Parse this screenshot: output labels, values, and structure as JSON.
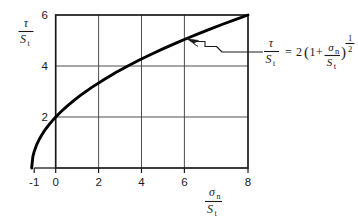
{
  "chart_data": {
    "type": "line",
    "title": "",
    "xlabel": "σn / St",
    "ylabel": "τ / St",
    "xlim": [
      -1,
      8
    ],
    "ylim": [
      0,
      6
    ],
    "grid": true,
    "legend": "none",
    "x_ticks": [
      -1,
      0,
      2,
      4,
      6,
      8
    ],
    "x_tick_labels": [
      "-1",
      "0",
      "2",
      "4",
      "6",
      "8"
    ],
    "y_ticks": [
      2,
      4,
      6
    ],
    "y_tick_labels": [
      "2",
      "4",
      "6"
    ],
    "x_gridlines": [
      2,
      4,
      6
    ],
    "y_gridlines": [
      2,
      4
    ],
    "series": [
      {
        "name": "τ/St = 2(1 + σn/St)^(1/2)",
        "x": [
          -1.0,
          -0.95,
          -0.9,
          -0.8,
          -0.7,
          -0.6,
          -0.5,
          -0.4,
          -0.25,
          -0.1,
          0.0,
          0.25,
          0.5,
          0.75,
          1.0,
          1.5,
          2.0,
          2.5,
          3.0,
          3.5,
          4.0,
          4.5,
          5.0,
          5.5,
          6.0,
          6.5,
          7.0,
          7.5,
          8.0
        ],
        "y": [
          0.0,
          0.447,
          0.632,
          0.894,
          1.095,
          1.265,
          1.414,
          1.549,
          1.732,
          1.897,
          2.0,
          2.236,
          2.449,
          2.646,
          2.828,
          3.162,
          3.464,
          3.742,
          4.0,
          4.243,
          4.472,
          4.69,
          4.899,
          5.099,
          5.292,
          5.477,
          5.657,
          5.831,
          6.0
        ]
      }
    ],
    "annotations": [
      {
        "text": "τ/St = 2(1 + σn/St)^(1/2)",
        "points_to_x": 5.3,
        "points_to_y": 5.05
      }
    ]
  },
  "axes": {
    "y_label": {
      "numerator": "τ",
      "denominator_base": "S",
      "denominator_sub": "t"
    },
    "x_label": {
      "numerator_base": "σ",
      "numerator_sub": "n",
      "denominator_base": "S",
      "denominator_sub": "t"
    },
    "x_tick_labels": [
      "-1",
      "0",
      "2",
      "4",
      "6",
      "8"
    ],
    "y_tick_labels": [
      "2",
      "4",
      "6"
    ]
  },
  "equation": {
    "lhs_numerator": "τ",
    "lhs_denominator_base": "S",
    "lhs_denominator_sub": "t",
    "equals": "=",
    "coefficient": "2",
    "open_paren": "(",
    "one": "1",
    "plus": "+",
    "frac_numerator_base": "σ",
    "frac_numerator_sub": "n",
    "frac_denominator_base": "S",
    "frac_denominator_sub": "t",
    "close_paren": ")",
    "exponent_numerator": "1",
    "exponent_denominator": "2"
  },
  "colors": {
    "ink": "#1a1a1a",
    "curve": "#000000",
    "grid": "#3a3a3a",
    "background": "#ffffff"
  }
}
